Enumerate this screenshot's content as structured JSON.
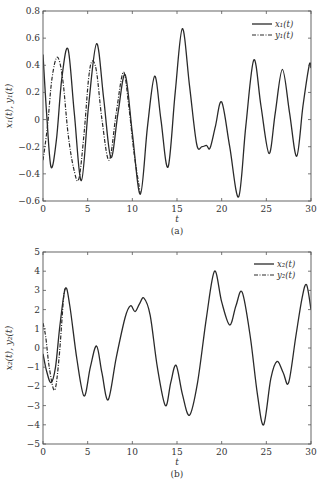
{
  "chart_data": [
    {
      "type": "line",
      "caption": "(a)",
      "xlabel": "t",
      "ylabel": "x1(t), y1(t)",
      "xlim": [
        0,
        30
      ],
      "ylim": [
        -0.6,
        0.8
      ],
      "xticks": [
        0,
        5,
        10,
        15,
        20,
        25,
        30
      ],
      "yticks": [
        -0.6,
        -0.4,
        -0.2,
        0,
        0.2,
        0.4,
        0.6,
        0.8
      ],
      "grid": false,
      "legend_position": "upper right",
      "series": [
        {
          "name": "x1(t)",
          "style": "solid",
          "points": [
            [
              0,
              0.48
            ],
            [
              0.4,
              0.05
            ],
            [
              0.9,
              -0.35
            ],
            [
              1.5,
              -0.15
            ],
            [
              2.1,
              0.3
            ],
            [
              2.8,
              0.52
            ],
            [
              3.5,
              0.05
            ],
            [
              4.3,
              -0.45
            ],
            [
              5.1,
              0.1
            ],
            [
              6.0,
              0.56
            ],
            [
              6.8,
              0.15
            ],
            [
              7.6,
              -0.28
            ],
            [
              8.4,
              0.05
            ],
            [
              9.2,
              0.33
            ],
            [
              10.0,
              -0.1
            ],
            [
              10.9,
              -0.55
            ],
            [
              11.7,
              -0.05
            ],
            [
              12.5,
              0.32
            ],
            [
              13.2,
              0.0
            ],
            [
              14.0,
              -0.35
            ],
            [
              14.8,
              0.2
            ],
            [
              15.6,
              0.67
            ],
            [
              16.4,
              0.25
            ],
            [
              17.2,
              -0.18
            ],
            [
              17.8,
              -0.2
            ],
            [
              18.3,
              -0.19
            ],
            [
              18.7,
              -0.21
            ],
            [
              19.3,
              -0.05
            ],
            [
              20.0,
              0.13
            ],
            [
              20.9,
              -0.2
            ],
            [
              21.9,
              -0.57
            ],
            [
              22.7,
              -0.05
            ],
            [
              23.6,
              0.44
            ],
            [
              24.4,
              0.1
            ],
            [
              25.3,
              -0.25
            ],
            [
              26.0,
              0.05
            ],
            [
              26.8,
              0.37
            ],
            [
              27.6,
              0.05
            ],
            [
              28.4,
              -0.27
            ],
            [
              29.1,
              0.1
            ],
            [
              29.8,
              0.4
            ],
            [
              30,
              0.38
            ]
          ]
        },
        {
          "name": "y1(t)",
          "style": "dashdot",
          "points": [
            [
              0,
              -0.3
            ],
            [
              0.5,
              -0.05
            ],
            [
              1.0,
              0.3
            ],
            [
              1.6,
              0.46
            ],
            [
              2.2,
              0.3
            ],
            [
              2.8,
              -0.1
            ],
            [
              3.4,
              -0.35
            ],
            [
              4.0,
              -0.44
            ],
            [
              4.6,
              -0.1
            ],
            [
              5.1,
              0.3
            ],
            [
              5.5,
              0.43
            ],
            [
              6.0,
              0.35
            ],
            [
              6.6,
              0.0
            ],
            [
              7.4,
              -0.3
            ],
            [
              8.2,
              0.05
            ],
            [
              9.0,
              0.35
            ],
            [
              9.6,
              0.1
            ],
            [
              10.2,
              -0.25
            ],
            [
              10.9,
              -0.55
            ]
          ]
        }
      ]
    },
    {
      "type": "line",
      "caption": "(b)",
      "xlabel": "t",
      "ylabel": "x2(t), y2(t)",
      "xlim": [
        0,
        30
      ],
      "ylim": [
        -5,
        5
      ],
      "xticks": [
        0,
        5,
        10,
        15,
        20,
        25,
        30
      ],
      "yticks": [
        -5,
        -4,
        -3,
        -2,
        -1,
        0,
        1,
        2,
        3,
        4,
        5
      ],
      "grid": false,
      "legend_position": "upper right",
      "series": [
        {
          "name": "x2(t)",
          "style": "solid",
          "points": [
            [
              0,
              -0.3
            ],
            [
              0.4,
              -1.2
            ],
            [
              0.9,
              -1.8
            ],
            [
              1.4,
              -1.0
            ],
            [
              1.9,
              1.2
            ],
            [
              2.5,
              3.1
            ],
            [
              3.0,
              2.2
            ],
            [
              3.8,
              -0.6
            ],
            [
              4.6,
              -2.5
            ],
            [
              5.3,
              -1.0
            ],
            [
              6.0,
              0.1
            ],
            [
              6.6,
              -1.3
            ],
            [
              7.3,
              -2.7
            ],
            [
              8.2,
              -0.5
            ],
            [
              9.2,
              1.6
            ],
            [
              9.8,
              2.2
            ],
            [
              10.3,
              1.9
            ],
            [
              10.8,
              2.3
            ],
            [
              11.3,
              2.6
            ],
            [
              12.0,
              1.7
            ],
            [
              12.8,
              -1.0
            ],
            [
              13.7,
              -3.0
            ],
            [
              14.3,
              -1.8
            ],
            [
              14.9,
              -0.9
            ],
            [
              15.6,
              -2.4
            ],
            [
              16.4,
              -3.5
            ],
            [
              17.3,
              -1.8
            ],
            [
              18.3,
              1.6
            ],
            [
              19.2,
              4.0
            ],
            [
              20.0,
              2.4
            ],
            [
              20.9,
              1.2
            ],
            [
              21.6,
              2.2
            ],
            [
              22.3,
              2.9
            ],
            [
              23.2,
              0.6
            ],
            [
              24.0,
              -2.4
            ],
            [
              24.7,
              -4.0
            ],
            [
              25.5,
              -1.6
            ],
            [
              26.2,
              -0.7
            ],
            [
              26.9,
              -1.3
            ],
            [
              27.5,
              -1.8
            ],
            [
              28.3,
              0.6
            ],
            [
              29.0,
              2.6
            ],
            [
              29.5,
              3.3
            ],
            [
              30,
              2.0
            ]
          ]
        },
        {
          "name": "y2(t)",
          "style": "dashdot",
          "points": [
            [
              0,
              1.3
            ],
            [
              0.3,
              0.6
            ],
            [
              0.7,
              -1.0
            ],
            [
              1.3,
              -2.2
            ],
            [
              1.8,
              -0.5
            ],
            [
              2.3,
              2.6
            ],
            [
              2.5,
              3.1
            ]
          ]
        }
      ]
    }
  ],
  "plot_a": {
    "ylabel": "x₁(t), y₁(t)",
    "xlabel": "t",
    "caption": "(a)",
    "xticks": [
      "0",
      "5",
      "10",
      "15",
      "20",
      "25",
      "30"
    ],
    "yticks": [
      "−0.6",
      "−0.4",
      "−0.2",
      "0",
      "0.2",
      "0.4",
      "0.6",
      "0.8"
    ],
    "legend": {
      "x": "x₁(t)",
      "y": "y₁(t)"
    }
  },
  "plot_b": {
    "ylabel": "x₂(t), y₂(t)",
    "xlabel": "t",
    "caption": "(b)",
    "xticks": [
      "0",
      "5",
      "10",
      "15",
      "20",
      "25",
      "30"
    ],
    "yticks": [
      "−5",
      "−4",
      "−3",
      "−2",
      "−1",
      "0",
      "1",
      "2",
      "3",
      "4",
      "5"
    ],
    "legend": {
      "x": "x₂(t)",
      "y": "y₂(t)"
    }
  },
  "colors": {
    "line": "#2a2a2a",
    "axis": "#555555",
    "background": "#ffffff"
  }
}
